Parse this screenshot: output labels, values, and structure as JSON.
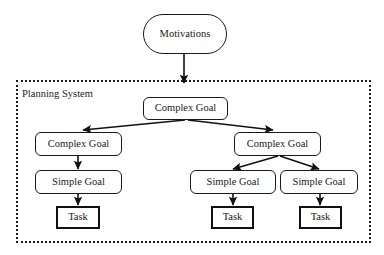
{
  "diagram": {
    "container": {
      "label": "Planning System",
      "border_style": "dotted",
      "color": "#1a1a1a",
      "x": 16,
      "y": 80,
      "width": 355,
      "height": 163,
      "label_x": 22,
      "label_y": 88
    },
    "nodes": [
      {
        "id": "motivations",
        "label": "Motivations",
        "shape": "pill",
        "x": 143,
        "y": 14,
        "width": 84,
        "height": 40
      },
      {
        "id": "complex-goal-root",
        "label": "Complex Goal",
        "shape": "rounded",
        "x": 143,
        "y": 97,
        "width": 85,
        "height": 23
      },
      {
        "id": "complex-goal-left",
        "label": "Complex Goal",
        "shape": "rounded",
        "x": 35,
        "y": 132,
        "width": 87,
        "height": 24
      },
      {
        "id": "complex-goal-right",
        "label": "Complex Goal",
        "shape": "rounded",
        "x": 234,
        "y": 132,
        "width": 87,
        "height": 24
      },
      {
        "id": "simple-goal-left",
        "label": "Simple Goal",
        "shape": "rounded",
        "x": 35,
        "y": 170,
        "width": 87,
        "height": 24
      },
      {
        "id": "simple-goal-middle",
        "label": "Simple Goal",
        "shape": "rounded",
        "x": 190,
        "y": 170,
        "width": 86,
        "height": 24
      },
      {
        "id": "simple-goal-right",
        "label": "Simple Goal",
        "shape": "rounded",
        "x": 280,
        "y": 170,
        "width": 78,
        "height": 24
      },
      {
        "id": "task-left",
        "label": "Task",
        "shape": "square",
        "x": 56,
        "y": 206,
        "width": 44,
        "height": 23
      },
      {
        "id": "task-middle",
        "label": "Task",
        "shape": "square",
        "x": 211,
        "y": 206,
        "width": 43,
        "height": 23
      },
      {
        "id": "task-right",
        "label": "Task",
        "shape": "square",
        "x": 299,
        "y": 206,
        "width": 43,
        "height": 23
      }
    ],
    "edges": [
      {
        "id": "edge-motivations-to-root",
        "from": "motivations",
        "to": "complex-goal-root",
        "x1": 184,
        "y1": 54,
        "x2": 184,
        "y2": 83
      },
      {
        "id": "edge-root-to-complex-left",
        "from": "complex-goal-root",
        "to": "complex-goal-left",
        "x1": 185,
        "y1": 120,
        "x2": 83,
        "y2": 130
      },
      {
        "id": "edge-root-to-complex-right",
        "from": "complex-goal-root",
        "to": "complex-goal-right",
        "x1": 188,
        "y1": 120,
        "x2": 273,
        "y2": 130
      },
      {
        "id": "edge-complex-left-to-simple-left",
        "from": "complex-goal-left",
        "to": "simple-goal-left",
        "x1": 78,
        "y1": 156,
        "x2": 78,
        "y2": 169
      },
      {
        "id": "edge-complex-right-to-simple-middle",
        "from": "complex-goal-right",
        "to": "simple-goal-middle",
        "x1": 278,
        "y1": 156,
        "x2": 233,
        "y2": 169
      },
      {
        "id": "edge-complex-right-to-simple-right",
        "from": "complex-goal-right",
        "to": "simple-goal-right",
        "x1": 280,
        "y1": 156,
        "x2": 319,
        "y2": 169
      },
      {
        "id": "edge-simple-left-to-task-left",
        "from": "simple-goal-left",
        "to": "task-left",
        "x1": 78,
        "y1": 194,
        "x2": 78,
        "y2": 205
      },
      {
        "id": "edge-simple-middle-to-task-middle",
        "from": "simple-goal-middle",
        "to": "task-middle",
        "x1": 233,
        "y1": 194,
        "x2": 233,
        "y2": 205
      },
      {
        "id": "edge-simple-right-to-task-right",
        "from": "simple-goal-right",
        "to": "task-right",
        "x1": 320,
        "y1": 194,
        "x2": 320,
        "y2": 205
      }
    ]
  }
}
